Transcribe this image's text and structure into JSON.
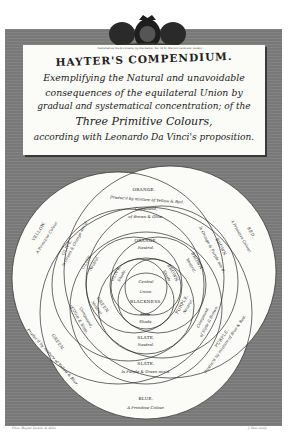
{
  "plate": {
    "background_color": "#7d7d7d",
    "paper_color": "#fbfbf8",
    "line_color": "#2a2a2a"
  },
  "crest": {
    "icon": "royal-coat-of-arms-icon",
    "imprint_line": "Published as the Act directs, by the Author, No. 13 St. Martin's Le Grand, London"
  },
  "title": {
    "main": "HAYTER'S COMPENDIUM.",
    "lines": [
      "Exemplifying the Natural and unavoidable",
      "consequences of the equilateral Union by",
      "gradual and systematical concentration; of the",
      "Three Primitive Colours,",
      "according with Leonardo Da Vinci's proposition."
    ]
  },
  "diagram": {
    "outer": {
      "yellow": {
        "name": "YELLOW.",
        "desc": "A Primitive Colour."
      },
      "red": {
        "name": "RED.",
        "desc": "A Primitive Colour."
      },
      "blue": {
        "name": "BLUE.",
        "desc": "A Primitive Colour."
      },
      "orange": {
        "name": "ORANGE.",
        "desc": "Produc'd by mixture of Yellow & Red."
      },
      "green": {
        "name": "GREEN.",
        "desc": "Produc'd by mixture of Yellow & Blue."
      },
      "purple": {
        "name": "PURPLE.",
        "desc": "Produc'd by mixture of Blue & Red."
      }
    },
    "middle": {
      "olive": {
        "name": "OLIVE.",
        "desc": "Is Green & Orange mix'd."
      },
      "brown": {
        "name": "BROWN.",
        "desc": "Is Orange & Purple mix'd."
      },
      "slate": {
        "name": "SLATE.",
        "desc": "Is Purple & Green mix'd."
      },
      "compound_top": {
        "name": "Compound,",
        "desc": "of Brown & Olive."
      },
      "compound_left": {
        "name": "Compound,",
        "desc": "of Olive & Slate."
      },
      "compound_right": {
        "name": "Compound,",
        "desc": "of Slate & Brown."
      }
    },
    "inner": {
      "orange": {
        "name": "ORANGE.",
        "desc": "Neutral."
      },
      "olive": {
        "name": "OLIVE.",
        "desc": "Neutral."
      },
      "brown": {
        "name": "BROWN.",
        "desc": "Neutral."
      },
      "green": {
        "name": "GREEN.",
        "desc": "Neutral."
      },
      "purple": {
        "name": "PURPLE.",
        "desc": "Neutral."
      },
      "slate": {
        "name": "SLATE.",
        "desc": "Neutral."
      }
    },
    "core": {
      "olive_shade": {
        "name": "OLIVE.",
        "desc": "Shade."
      },
      "brown_shade": {
        "name": "BROWN.",
        "desc": "Shade."
      },
      "slate_shade": {
        "name": "Slate.",
        "desc": "Shade."
      },
      "center": [
        "Central",
        "Union.",
        "BLACKNESS."
      ]
    }
  },
  "credits": {
    "left": "Chas. Hayter Invent. & delin.",
    "right": "J. Pass sculp."
  }
}
